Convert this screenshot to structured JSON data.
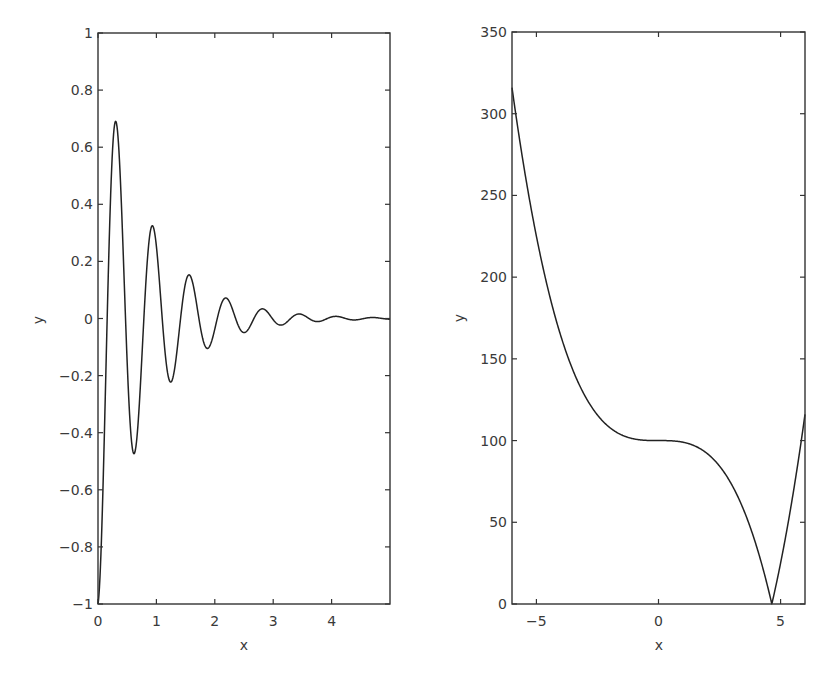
{
  "chart_data": [
    {
      "type": "line",
      "title": "",
      "xlabel": "x",
      "ylabel": "y",
      "xlim": [
        0,
        5
      ],
      "ylim": [
        -1,
        1
      ],
      "grid": false,
      "legend": null,
      "xticks": [
        0,
        1,
        2,
        3,
        4
      ],
      "xtick_labels": [
        "0",
        "1",
        "2",
        "3",
        "4"
      ],
      "yticks": [
        -1,
        -0.8,
        -0.6,
        -0.4,
        -0.2,
        0,
        0.2,
        0.4,
        0.6,
        0.8,
        1
      ],
      "ytick_labels": [
        "−1",
        "−0.8",
        "−0.6",
        "−0.4",
        "−0.2",
        "0",
        "0.2",
        "0.4",
        "0.6",
        "0.8",
        "1"
      ],
      "description": "Damped oscillation starting at y=-1, approx y = -exp(-1.2x)*cos(10x)",
      "key_points": [
        {
          "x": 0.0,
          "y": -1.0
        },
        {
          "x": 0.29,
          "y": 0.71
        },
        {
          "x": 0.6,
          "y": -0.49
        },
        {
          "x": 0.9,
          "y": 0.33
        },
        {
          "x": 1.22,
          "y": -0.23
        },
        {
          "x": 1.53,
          "y": 0.16
        },
        {
          "x": 1.84,
          "y": -0.11
        },
        {
          "x": 2.15,
          "y": 0.075
        },
        {
          "x": 2.46,
          "y": -0.05
        },
        {
          "x": 2.78,
          "y": 0.035
        },
        {
          "x": 3.09,
          "y": -0.025
        },
        {
          "x": 3.4,
          "y": 0.017
        },
        {
          "x": 3.71,
          "y": -0.012
        },
        {
          "x": 4.02,
          "y": 0.008
        },
        {
          "x": 4.65,
          "y": 0.004
        },
        {
          "x": 5.0,
          "y": 0.0
        }
      ],
      "curve": {
        "fn": "damped",
        "amp": -1,
        "decay": 1.2,
        "omega": 10,
        "samples": 600
      }
    },
    {
      "type": "line",
      "title": "",
      "xlabel": "x",
      "ylabel": "y",
      "xlim": [
        -6,
        6
      ],
      "ylim": [
        0,
        350
      ],
      "grid": false,
      "legend": null,
      "xticks": [
        -5,
        0,
        5
      ],
      "xtick_labels": [
        "−5",
        "0",
        "5"
      ],
      "yticks": [
        0,
        50,
        100,
        150,
        200,
        250,
        300,
        350
      ],
      "ytick_labels": [
        "0",
        "50",
        "100",
        "150",
        "200",
        "250",
        "300",
        "350"
      ],
      "description": "y = |100 - x^3|",
      "key_points": [
        {
          "x": -6,
          "y": 316
        },
        {
          "x": -5,
          "y": 225
        },
        {
          "x": -4,
          "y": 164
        },
        {
          "x": -3,
          "y": 127
        },
        {
          "x": -2,
          "y": 108
        },
        {
          "x": -1,
          "y": 101
        },
        {
          "x": 0,
          "y": 100
        },
        {
          "x": 1,
          "y": 99
        },
        {
          "x": 2,
          "y": 92
        },
        {
          "x": 3,
          "y": 73
        },
        {
          "x": 4,
          "y": 36
        },
        {
          "x": 4.64,
          "y": 0
        },
        {
          "x": 5,
          "y": 25
        },
        {
          "x": 6,
          "y": 116
        }
      ],
      "curve": {
        "fn": "abs_cubic",
        "c": 100,
        "samples": 600
      }
    }
  ],
  "panels": [
    {
      "frame": {
        "x0": 98,
        "y0": 33,
        "x1": 390,
        "y1": 604
      },
      "ylabel_pos": {
        "x": 43,
        "y": 320
      },
      "xlabel_pos": {
        "x": 244,
        "y": 650
      }
    },
    {
      "frame": {
        "x0": 512,
        "y0": 32,
        "x1": 805,
        "y1": 604
      },
      "ylabel_pos": {
        "x": 464,
        "y": 318
      },
      "xlabel_pos": {
        "x": 659,
        "y": 650
      }
    }
  ]
}
